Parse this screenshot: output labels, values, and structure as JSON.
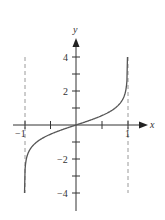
{
  "chart_data": {
    "type": "line",
    "title": "",
    "function": "y = tanh^-1(x)",
    "xlabel": "x",
    "ylabel": "y",
    "xlim": [
      -1.2,
      1.3
    ],
    "ylim": [
      -5,
      5
    ],
    "grid": false,
    "legend": null,
    "x_ticks": [
      -1,
      -0.5,
      0.5,
      1
    ],
    "x_tick_labels": {
      "-1": "−1",
      "1": "1"
    },
    "y_ticks": [
      -4,
      -3,
      -2,
      -1,
      1,
      2,
      3,
      4
    ],
    "y_tick_labels": {
      "4": "4",
      "2": "2",
      "-2": "−2",
      "-4": "−4"
    },
    "asymptotes": [
      {
        "x": -1,
        "style": "dashed"
      },
      {
        "x": 1,
        "style": "dashed"
      }
    ],
    "series": [
      {
        "name": "tanh^-1(x)",
        "x": [
          -0.9993,
          -0.995,
          -0.98,
          -0.95,
          -0.9,
          -0.8,
          -0.6,
          -0.4,
          -0.2,
          0,
          0.2,
          0.4,
          0.6,
          0.8,
          0.9,
          0.95,
          0.98,
          0.995,
          0.9993
        ],
        "values": [
          -4.0,
          -2.99,
          -2.3,
          -1.83,
          -1.47,
          -1.1,
          -0.69,
          -0.42,
          -0.2,
          0,
          0.2,
          0.42,
          0.69,
          1.1,
          1.47,
          1.83,
          2.3,
          2.99,
          4.0
        ]
      }
    ],
    "colors": {
      "curve": "#555555",
      "axis": "#333333",
      "asymptote": "#999999"
    }
  },
  "labels": {
    "x_axis": "x",
    "y_axis": "y",
    "x_neg1": "−1",
    "x_pos1": "1",
    "y_4": "4",
    "y_2": "2",
    "y_neg2": "−2",
    "y_neg4": "−4"
  }
}
